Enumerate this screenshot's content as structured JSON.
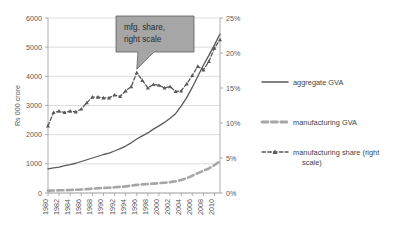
{
  "chart_data": {
    "type": "line",
    "title": "",
    "subtitle": "",
    "xlabel": "",
    "ylabel": "Rs 000 crore",
    "y2label": "",
    "ylim": [
      0,
      6000
    ],
    "y2lim": [
      0,
      0.25
    ],
    "xlim": [
      1980,
      2011
    ],
    "grid": true,
    "legend_position": "right",
    "yticks": [
      "0",
      "1000",
      "2000",
      "3000",
      "4000",
      "5000",
      "6000"
    ],
    "ytick_values": [
      0,
      1000,
      2000,
      3000,
      4000,
      5000,
      6000
    ],
    "y2ticks": [
      "0%",
      "5%",
      "10%",
      "15%",
      "20%",
      "25%"
    ],
    "y2tick_values": [
      0,
      5,
      10,
      15,
      20,
      25
    ],
    "xticks": [
      "1980",
      "1982",
      "1984",
      "1986",
      "1988",
      "1990",
      "1992",
      "1994",
      "1996",
      "1998",
      "2000",
      "2002",
      "2004",
      "2006",
      "2008",
      "2010"
    ],
    "xtick_values": [
      1980,
      1982,
      1984,
      1986,
      1988,
      1990,
      1992,
      1994,
      1996,
      1998,
      2000,
      2002,
      2004,
      2006,
      2008,
      2010
    ],
    "x": [
      1980,
      1981,
      1982,
      1983,
      1984,
      1985,
      1986,
      1987,
      1988,
      1989,
      1990,
      1991,
      1992,
      1993,
      1994,
      1995,
      1996,
      1997,
      1998,
      1999,
      2000,
      2001,
      2002,
      2003,
      2004,
      2005,
      2006,
      2007,
      2008,
      2009,
      2010,
      2011
    ],
    "series": [
      {
        "name": "aggregate GVA",
        "axis": "left",
        "units": "Rs 000 crore",
        "style": "solid",
        "marker": "none",
        "color": "#595959",
        "values": [
          830,
          860,
          890,
          940,
          975,
          1020,
          1080,
          1140,
          1200,
          1260,
          1320,
          1370,
          1440,
          1520,
          1610,
          1720,
          1850,
          1960,
          2060,
          2190,
          2300,
          2420,
          2560,
          2720,
          2980,
          3270,
          3620,
          4000,
          4380,
          4720,
          5080,
          5450
        ]
      },
      {
        "name": "manufacturing GVA",
        "axis": "left",
        "units": "Rs 000 crore",
        "style": "dashed",
        "marker": "none",
        "color": "#a6a6a6",
        "values": [
          80,
          85,
          92,
          98,
          102,
          110,
          120,
          132,
          148,
          162,
          176,
          182,
          196,
          210,
          228,
          252,
          278,
          296,
          308,
          322,
          336,
          352,
          372,
          400,
          448,
          510,
          590,
          680,
          760,
          840,
          960,
          1090
        ]
      },
      {
        "name": "manufacturing share (right scale)",
        "axis": "right",
        "units": "%",
        "style": "dashed",
        "marker": "triangle",
        "color": "#595959",
        "values": [
          9.6,
          11.5,
          11.7,
          11.5,
          11.7,
          11.6,
          12.0,
          12.9,
          13.7,
          13.7,
          13.6,
          13.6,
          14.0,
          13.8,
          14.6,
          15.2,
          17.2,
          16.1,
          15.0,
          15.5,
          15.4,
          15.0,
          15.2,
          14.5,
          14.6,
          15.6,
          16.8,
          18.1,
          17.6,
          18.8,
          20.7,
          21.9
        ]
      }
    ],
    "annotations": [
      {
        "name": "mfg-share-callout",
        "text_line1": "mfg. share,",
        "text_line2": "right scale",
        "points_to_x": 1996,
        "points_to_y_pct": 17.2
      }
    ]
  },
  "legend": {
    "items": [
      {
        "label": "aggregate GVA",
        "style": "solid",
        "marker": "none"
      },
      {
        "label": "manufacturing GVA",
        "style": "dashed",
        "marker": "none"
      },
      {
        "label": "manufacturing share (right",
        "label2": "scale)",
        "style": "dashed",
        "marker": "triangle"
      }
    ]
  },
  "colors": {
    "background": "#ffffff",
    "aggregate": "#595959",
    "manufacturing": "#a6a6a6",
    "share": "#595959",
    "grid": "#d0d0d0",
    "axis": "#9a9a9a",
    "callout_fill": "#a6a6a6",
    "callout_stroke": "#5e5e5e",
    "text": "#595959"
  }
}
